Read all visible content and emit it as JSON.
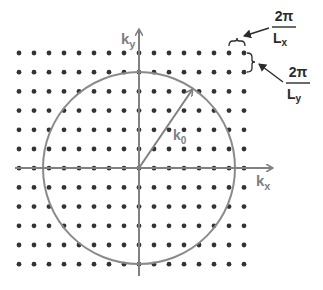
{
  "diagram": {
    "type": "reciprocal-lattice-k-space",
    "axes": {
      "x_label": "k",
      "x_sub": "x",
      "y_label": "k",
      "y_sub": "y"
    },
    "wavevector": {
      "label": "k",
      "sub": "0"
    },
    "spacing_x": {
      "numerator": "2π",
      "denominator": "L",
      "denominator_sub": "x"
    },
    "spacing_y": {
      "numerator": "2π",
      "denominator": "L",
      "denominator_sub": "y"
    },
    "grid": {
      "columns": 16,
      "rows": 12,
      "x0": 19,
      "dx": 15,
      "y0": 53,
      "dy": 19.2
    },
    "circle": {
      "cx": 139,
      "cy": 168,
      "r": 96
    },
    "colors": {
      "dot": "#333333",
      "axis": "#808080",
      "circle": "#8a8a8a",
      "annotation": "#2b2b2b"
    }
  }
}
